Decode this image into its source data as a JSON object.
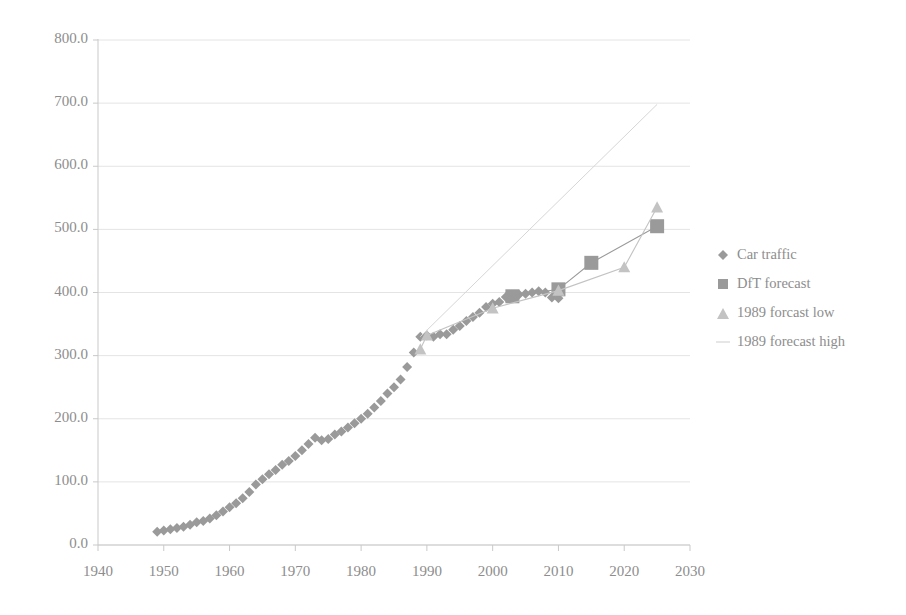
{
  "chart_data": {
    "type": "scatter",
    "title": "",
    "xlabel": "",
    "ylabel": "",
    "xlim": [
      1940,
      2030
    ],
    "ylim": [
      0.0,
      800.0
    ],
    "xticks": [
      1940,
      1950,
      1960,
      1970,
      1980,
      1990,
      2000,
      2010,
      2020,
      2030
    ],
    "xtick_labels": [
      "1940",
      "1950",
      "1960",
      "1970",
      "1980",
      "1990",
      "2000",
      "2010",
      "2020",
      "2030"
    ],
    "yticks": [
      0,
      100,
      200,
      300,
      400,
      500,
      600,
      700,
      800
    ],
    "ytick_labels": [
      "0.0",
      "100.0",
      "200.0",
      "300.0",
      "400.0",
      "500.0",
      "600.0",
      "700.0",
      "800.0"
    ],
    "grid": true,
    "legend_position": "right",
    "series": [
      {
        "name": "Car traffic",
        "marker": "diamond",
        "color": "#9a9a9a",
        "x": [
          1949,
          1950,
          1951,
          1952,
          1953,
          1954,
          1955,
          1956,
          1957,
          1958,
          1959,
          1960,
          1961,
          1962,
          1963,
          1964,
          1965,
          1966,
          1967,
          1968,
          1969,
          1970,
          1971,
          1972,
          1973,
          1974,
          1975,
          1976,
          1977,
          1978,
          1979,
          1980,
          1981,
          1982,
          1983,
          1984,
          1985,
          1986,
          1987,
          1988,
          1989,
          1990,
          1991,
          1992,
          1993,
          1994,
          1995,
          1996,
          1997,
          1998,
          1999,
          2000,
          2001,
          2002,
          2003,
          2004,
          2005,
          2006,
          2007,
          2008,
          2009,
          2010
        ],
        "y": [
          21,
          23,
          25,
          27,
          29,
          32,
          36,
          38,
          42,
          47,
          53,
          60,
          66,
          74,
          84,
          96,
          104,
          112,
          119,
          127,
          133,
          141,
          150,
          160,
          170,
          166,
          168,
          175,
          180,
          186,
          193,
          200,
          208,
          218,
          228,
          240,
          250,
          262,
          282,
          305,
          330,
          332,
          330,
          334,
          334,
          341,
          347,
          355,
          361,
          368,
          377,
          382,
          385,
          393,
          394,
          397,
          398,
          400,
          402,
          400,
          392,
          391
        ]
      },
      {
        "name": "DfT forecast",
        "marker": "square",
        "color": "#9a9a9a",
        "x": [
          2003,
          2010,
          2015,
          2025
        ],
        "y": [
          394,
          405,
          447,
          505
        ]
      },
      {
        "name": "1989 forcast low",
        "marker": "triangle",
        "color": "#c3c3c3",
        "x": [
          1989,
          1990,
          2000,
          2010,
          2020,
          2025
        ],
        "y": [
          310,
          332,
          375,
          403,
          440,
          535
        ]
      },
      {
        "name": "1989 forecast high",
        "marker": "line",
        "color": "#d6d6d6",
        "x": [
          1989,
          2025
        ],
        "y": [
          330,
          698
        ]
      }
    ]
  },
  "legend": {
    "items": [
      {
        "label": "Car traffic",
        "marker": "diamond",
        "color": "#9a9a9a"
      },
      {
        "label": "DfT forecast",
        "marker": "square",
        "color": "#9a9a9a"
      },
      {
        "label": "1989 forcast low",
        "marker": "triangle",
        "color": "#c3c3c3"
      },
      {
        "label": "1989 forecast high",
        "marker": "line",
        "color": "#dcdcdc"
      }
    ]
  },
  "colors": {
    "grid": "#e4e4e4",
    "axis": "#c9c9c9",
    "text": "#8d8d8d",
    "background": "#ffffff"
  }
}
